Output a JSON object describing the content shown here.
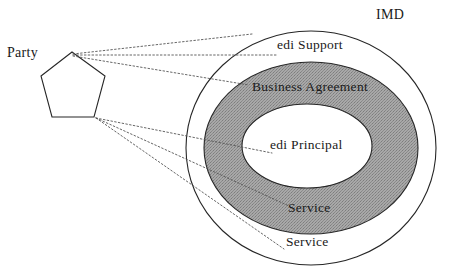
{
  "diagram": {
    "title_label": "IMD",
    "actor": {
      "name": "Party",
      "shape": "pentagon"
    },
    "rings": [
      {
        "id": "outer",
        "label": "edi Support",
        "fill": "#ffffff",
        "stroke": "#262626"
      },
      {
        "id": "middle",
        "label": "Business Agreement",
        "fill": "#9a9a9a",
        "stroke": "#262626"
      },
      {
        "id": "inner",
        "label": "edi Principal",
        "fill": "#ffffff",
        "stroke": "#262626"
      }
    ],
    "service_labels": [
      {
        "id": "service-in-business-agreement",
        "text": "Service"
      },
      {
        "id": "service-in-edi-support",
        "text": "Service"
      }
    ],
    "connector_style": "dotted",
    "colors": {
      "ink": "#1a1a1a",
      "stroke": "#262626",
      "gray_fill": "#9a9a9a",
      "white_fill": "#ffffff",
      "connector": "#555555"
    }
  }
}
